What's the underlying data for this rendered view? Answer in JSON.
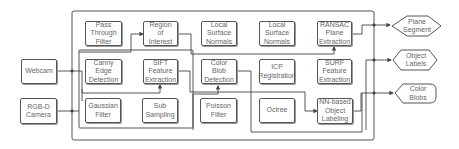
{
  "diagram": {
    "inputs": [
      {
        "id": "webcam",
        "label": "Webcam"
      },
      {
        "id": "rgbd",
        "label": "RGB-D\nCamera"
      }
    ],
    "row1": [
      {
        "id": "pass_through",
        "label": "Pass\nThrough\nFilter"
      },
      {
        "id": "roi",
        "label": "Region\nof\nInterest"
      },
      {
        "id": "normals1",
        "label": "Local\nSurface\nNormals"
      },
      {
        "id": "normals2",
        "label": "Local\nSurface\nNormals"
      },
      {
        "id": "ransac",
        "label": "RANSAC\nPlane\nExtraction"
      }
    ],
    "row2": [
      {
        "id": "canny",
        "label": "Canny\nEdge\nDetection"
      },
      {
        "id": "sift",
        "label": "SIFT\nFeature\nExtraction"
      },
      {
        "id": "color_blob",
        "label": "Color\nBlob\nDetection"
      },
      {
        "id": "icp",
        "label": "ICP\nRegistration"
      },
      {
        "id": "surf",
        "label": "SURF\nFeature\nExtraction"
      }
    ],
    "row3": [
      {
        "id": "gaussian",
        "label": "Gaussian\nFilter"
      },
      {
        "id": "subsampling",
        "label": "Sub\nSampling"
      },
      {
        "id": "poisson",
        "label": "Poisson\nFilter"
      },
      {
        "id": "octree",
        "label": "Octree"
      },
      {
        "id": "nn_labeling",
        "label": "NN-based\nObject\nLabeling"
      }
    ],
    "outputs": [
      {
        "id": "plane_segment",
        "label": "Plane\nSegment",
        "shape": "diamond"
      },
      {
        "id": "object_labels",
        "label": "Object\nLabels",
        "shape": "hexagon"
      },
      {
        "id": "color_blobs",
        "label": "Color\nBlobs",
        "shape": "pointed-left"
      }
    ],
    "colors": {
      "line": "#444444",
      "box_border": "#555555",
      "text": "#666666"
    }
  }
}
